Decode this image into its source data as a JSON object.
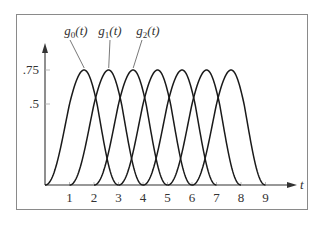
{
  "chart_data": {
    "type": "line",
    "title": "",
    "xlabel": "t",
    "ylabel": "",
    "x_ticks": [
      1,
      2,
      3,
      4,
      5,
      6,
      7,
      8,
      9
    ],
    "y_ticks": [
      {
        "value": 0.5,
        "label": ".5"
      },
      {
        "value": 0.75,
        "label": ".75"
      }
    ],
    "xlim": [
      0,
      9.5
    ],
    "ylim": [
      0,
      0.9
    ],
    "grid": false,
    "legend": "annotations",
    "series": [
      {
        "name": "g0(t)",
        "support": [
          0,
          3
        ],
        "peak_t": 1.6,
        "peak_value": 0.75
      },
      {
        "name": "g1(t)",
        "support": [
          1,
          4
        ],
        "peak_t": 2.6,
        "peak_value": 0.75
      },
      {
        "name": "g2(t)",
        "support": [
          2,
          5
        ],
        "peak_t": 3.6,
        "peak_value": 0.75
      },
      {
        "name": "g3(t)",
        "support": [
          3,
          6
        ],
        "peak_t": 4.6,
        "peak_value": 0.75
      },
      {
        "name": "g4(t)",
        "support": [
          4,
          7
        ],
        "peak_t": 5.6,
        "peak_value": 0.75
      },
      {
        "name": "g5(t)",
        "support": [
          5,
          8
        ],
        "peak_t": 6.6,
        "peak_value": 0.75
      },
      {
        "name": "g6(t)",
        "support": [
          6,
          9
        ],
        "peak_t": 7.6,
        "peak_value": 0.75
      }
    ],
    "annotations": [
      {
        "text_base": "g",
        "subscript": "0",
        "suffix": "(t)",
        "points_to": "g0(t)"
      },
      {
        "text_base": "g",
        "subscript": "1",
        "suffix": "(t)",
        "points_to": "g1(t)"
      },
      {
        "text_base": "g",
        "subscript": "2",
        "suffix": "(t)",
        "points_to": "g2(t)"
      }
    ]
  },
  "colors": {
    "curve": "#1a1a1a",
    "axis": "#333333",
    "frame": "#8a8a8a"
  }
}
